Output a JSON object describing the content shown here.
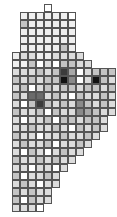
{
  "map": {
    "title": "Grid cartogram choropleth",
    "type": "grid-cartogram",
    "cell_size_px": 8,
    "origin_px": [
      12,
      4
    ],
    "grid_cols": 13,
    "grid_rows": 26,
    "background_color": "#ffffff",
    "border_color": "#555555",
    "palette": {
      "level0": "#ffffff",
      "level1": "#efefef",
      "level2": "#dcdcdc",
      "level3": "#c4c4c4",
      "level4": "#a8a8a8",
      "level5": "#8a8a8a",
      "level6": "#6a6a6a",
      "level7": "#3c3c3c",
      "level8": "#121212"
    }
  },
  "chart_data": {
    "type": "heatmap",
    "xlabel": "",
    "ylabel": "",
    "value_levels": [
      0,
      1,
      2,
      3,
      4,
      5,
      6,
      7,
      8
    ],
    "null_marker": -1,
    "note": "-1 = cell outside region (not drawn)",
    "cells": [
      [
        -1,
        -1,
        -1,
        -1,
        0,
        -1,
        -1,
        -1,
        -1,
        -1,
        -1,
        -1,
        -1
      ],
      [
        -1,
        1,
        1,
        1,
        1,
        1,
        1,
        0,
        -1,
        -1,
        -1,
        -1,
        -1
      ],
      [
        -1,
        3,
        1,
        1,
        1,
        1,
        1,
        1,
        -1,
        -1,
        -1,
        -1,
        -1
      ],
      [
        -1,
        1,
        1,
        1,
        1,
        1,
        1,
        1,
        -1,
        -1,
        -1,
        -1,
        -1
      ],
      [
        -1,
        1,
        1,
        1,
        1,
        1,
        1,
        1,
        -1,
        -1,
        -1,
        -1,
        -1
      ],
      [
        -1,
        1,
        1,
        1,
        1,
        1,
        3,
        1,
        -1,
        -1,
        -1,
        -1,
        -1
      ],
      [
        1,
        2,
        2,
        1,
        1,
        2,
        2,
        2,
        2,
        -1,
        -1,
        -1,
        -1
      ],
      [
        1,
        1,
        3,
        0,
        2,
        0,
        3,
        3,
        2,
        2,
        -1,
        -1,
        -1
      ],
      [
        2,
        2,
        2,
        3,
        2,
        3,
        7,
        4,
        0,
        2,
        3,
        3,
        3
      ],
      [
        3,
        2,
        3,
        2,
        3,
        3,
        8,
        5,
        0,
        2,
        8,
        3,
        2
      ],
      [
        2,
        3,
        0,
        2,
        3,
        2,
        3,
        3,
        2,
        3,
        3,
        2,
        3
      ],
      [
        3,
        2,
        6,
        6,
        2,
        3,
        2,
        0,
        3,
        2,
        2,
        3,
        2
      ],
      [
        2,
        0,
        3,
        7,
        3,
        2,
        3,
        2,
        5,
        3,
        2,
        3,
        2
      ],
      [
        3,
        2,
        2,
        3,
        0,
        3,
        2,
        2,
        5,
        4,
        3,
        2,
        2
      ],
      [
        2,
        0,
        2,
        2,
        3,
        0,
        3,
        3,
        2,
        3,
        3,
        2,
        -1
      ],
      [
        2,
        2,
        3,
        2,
        2,
        3,
        2,
        0,
        3,
        2,
        3,
        2,
        -1
      ],
      [
        3,
        2,
        2,
        0,
        2,
        2,
        3,
        2,
        2,
        3,
        2,
        -1,
        -1
      ],
      [
        2,
        3,
        2,
        2,
        3,
        0,
        2,
        2,
        3,
        2,
        -1,
        -1,
        -1
      ],
      [
        2,
        0,
        3,
        2,
        0,
        2,
        3,
        2,
        2,
        -1,
        -1,
        -1,
        -1
      ],
      [
        3,
        2,
        2,
        3,
        2,
        3,
        2,
        2,
        -1,
        -1,
        -1,
        -1,
        -1
      ],
      [
        2,
        2,
        0,
        2,
        2,
        0,
        2,
        -1,
        -1,
        -1,
        -1,
        -1,
        -1
      ],
      [
        3,
        0,
        2,
        2,
        3,
        2,
        -1,
        -1,
        -1,
        -1,
        -1,
        -1,
        -1
      ],
      [
        2,
        3,
        2,
        0,
        2,
        2,
        -1,
        -1,
        -1,
        -1,
        -1,
        -1,
        -1
      ],
      [
        3,
        2,
        3,
        2,
        2,
        -1,
        -1,
        -1,
        -1,
        -1,
        -1,
        -1,
        -1
      ],
      [
        3,
        0,
        3,
        2,
        2,
        -1,
        -1,
        -1,
        -1,
        -1,
        -1,
        -1,
        -1
      ],
      [
        2,
        2,
        2,
        0,
        -1,
        -1,
        -1,
        -1,
        -1,
        -1,
        -1,
        -1,
        -1
      ]
    ]
  }
}
